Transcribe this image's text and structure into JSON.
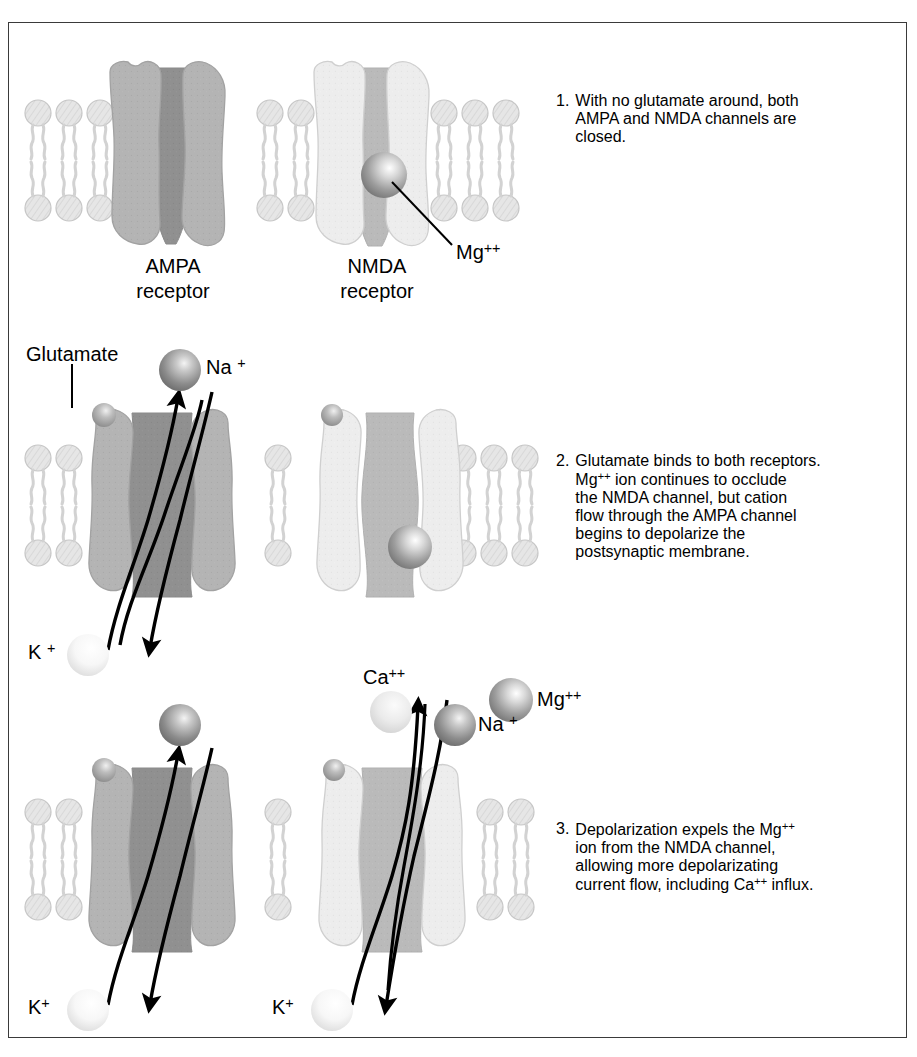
{
  "figure": {
    "border_color": "#3a3a3a",
    "background": "#ffffff"
  },
  "palette": {
    "ampa_body": "#b3b3b3",
    "ampa_pore": "#8f8f8f",
    "nmda_body": "#ececec",
    "nmda_pore": "#b9b9b9",
    "membrane_head": "#e2e2e2",
    "membrane_outline": "#c6c6c6",
    "sphere_mg": "#9a9a9a",
    "sphere_na": "#8a8a8a",
    "sphere_k": "#f2f2f2",
    "sphere_ca": "#e4e4e4",
    "flow_line": "#000000",
    "text": "#000000"
  },
  "captions": [
    {
      "number": "1.",
      "lines": [
        "With no glutamate around, both",
        "AMPA and NMDA channels are",
        "closed."
      ]
    },
    {
      "number": "2.",
      "lines": [
        "Glutamate binds to both receptors.",
        "Mg<sup>++</sup> ion continues to occlude",
        "the NMDA channel, but cation",
        "flow through the AMPA channel",
        "begins to depolarize the",
        "postsynaptic membrane."
      ]
    },
    {
      "number": "3.",
      "lines": [
        "Depolarization expels the Mg<sup>++</sup>",
        "ion from the NMDA channel,",
        "allowing more depolarizating",
        "current flow, including Ca<sup>++</sup> influx."
      ]
    }
  ],
  "panel1": {
    "ampa_label_line1": "AMPA",
    "ampa_label_line2": "receptor",
    "nmda_label_line1": "NMDA",
    "nmda_label_line2": "receptor",
    "mg_label": "Mg<sup>++</sup>",
    "ampa_state": "closed",
    "nmda_state": "closed",
    "mg_blocking": true
  },
  "panel2": {
    "glutamate_label": "Glutamate",
    "na_label": "Na <sup>+</sup>",
    "k_label": "K <sup>+</sup>",
    "ampa_state": "open",
    "nmda_state": "closed",
    "mg_blocking": true
  },
  "panel3": {
    "ca_label": "Ca<sup>++</sup>",
    "na_label": "Na <sup>+</sup>",
    "mg_label": "Mg<sup>++</sup>",
    "k_label_left": "K<sup>+</sup>",
    "k_label_right": "K<sup>+</sup>",
    "ampa_state": "open",
    "nmda_state": "open",
    "mg_blocking": false
  }
}
